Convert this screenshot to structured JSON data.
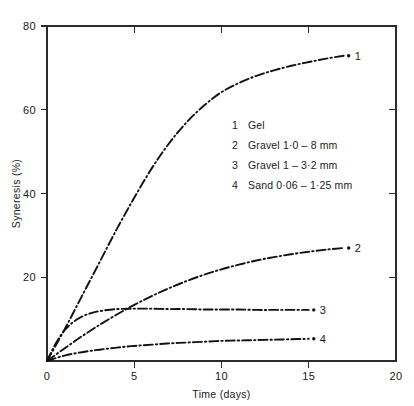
{
  "chart_data": {
    "type": "line",
    "title": "",
    "xlabel": "Time (days)",
    "ylabel": "Syneresis (%)",
    "xlim": [
      0,
      20
    ],
    "ylim": [
      0,
      80
    ],
    "xticks": [
      0,
      5,
      10,
      15,
      20
    ],
    "yticks": [
      0,
      20,
      40,
      60,
      80
    ],
    "xtick_labels": [
      "0",
      "5",
      "10",
      "15",
      "20"
    ],
    "ytick_labels": [
      "0",
      "20",
      "40",
      "60",
      "80"
    ],
    "grid": false,
    "legend_position": "center-right-inside",
    "line_style": "dash-dot",
    "series": [
      {
        "name": "1",
        "label": "Gel",
        "end_label": "1",
        "x": [
          0,
          1,
          2,
          3,
          4,
          5,
          6,
          7,
          8,
          9,
          10,
          11,
          12,
          13,
          14,
          15,
          16,
          17
        ],
        "y": [
          0,
          7.5,
          15.5,
          23.5,
          31.5,
          39.0,
          46.0,
          52.0,
          57.0,
          61.0,
          64.2,
          66.4,
          68.1,
          69.4,
          70.5,
          71.4,
          72.2,
          72.9
        ]
      },
      {
        "name": "2",
        "label": "Gravel 1·0 – 8 mm",
        "end_label": "2",
        "x": [
          0,
          1,
          2,
          3,
          4,
          5,
          6,
          7,
          8,
          9,
          10,
          11,
          12,
          13,
          14,
          15,
          16,
          17
        ],
        "y": [
          0,
          3.0,
          5.9,
          8.6,
          11.1,
          13.4,
          15.5,
          17.4,
          19.1,
          20.6,
          21.9,
          23.0,
          24.0,
          24.8,
          25.5,
          26.1,
          26.6,
          27.0
        ]
      },
      {
        "name": "3",
        "label": "Gravel 1 – 3·2 mm",
        "end_label": "3",
        "x": [
          0,
          0.5,
          1,
          1.5,
          2,
          2.5,
          3,
          4,
          5,
          6,
          7,
          8,
          9,
          10,
          11,
          12,
          13,
          14,
          15
        ],
        "y": [
          0,
          4.2,
          7.3,
          9.3,
          10.6,
          11.4,
          11.9,
          12.4,
          12.5,
          12.5,
          12.4,
          12.4,
          12.3,
          12.3,
          12.3,
          12.2,
          12.2,
          12.2,
          12.2
        ]
      },
      {
        "name": "4",
        "label": "Sand 0·06 – 1·25 mm",
        "end_label": "4",
        "x": [
          0,
          1,
          2,
          3,
          4,
          5,
          6,
          7,
          8,
          9,
          10,
          11,
          12,
          13,
          14,
          15
        ],
        "y": [
          0,
          1.3,
          2.1,
          2.7,
          3.2,
          3.6,
          3.9,
          4.2,
          4.4,
          4.6,
          4.8,
          4.9,
          5.0,
          5.1,
          5.2,
          5.3
        ]
      }
    ]
  },
  "legend": {
    "entries": [
      {
        "num": "1",
        "text": "Gel"
      },
      {
        "num": "2",
        "text": "Gravel 1·0 – 8 mm"
      },
      {
        "num": "3",
        "text": "Gravel 1 – 3·2 mm"
      },
      {
        "num": "4",
        "text": "Sand 0·06 – 1·25 mm"
      }
    ]
  },
  "axes": {
    "x_title": "Time (days)",
    "y_title": "Syneresis (%)",
    "x_labels": [
      "0",
      "5",
      "10",
      "15",
      "20"
    ],
    "y_labels": [
      "0",
      "20",
      "40",
      "60",
      "80"
    ]
  },
  "curve_end_labels": [
    "1",
    "2",
    "3",
    "4"
  ]
}
